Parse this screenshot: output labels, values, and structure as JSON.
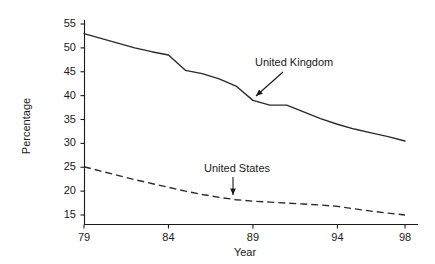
{
  "chart_data": {
    "type": "line",
    "title": "",
    "xlabel": "Year",
    "ylabel": "Percentage",
    "xlim": [
      78.0,
      99.2
    ],
    "ylim": [
      13.0,
      56.8
    ],
    "grid": false,
    "legend_position": "inline-annotations",
    "x_ticks": [
      79,
      84,
      89,
      94,
      98
    ],
    "x_tick_labels": [
      "79",
      "84",
      "89",
      "94",
      "98"
    ],
    "y_ticks": [
      15,
      20,
      25,
      30,
      35,
      40,
      45,
      50,
      55
    ],
    "y_tick_labels": [
      "15",
      "20",
      "25",
      "30",
      "35",
      "40",
      "45",
      "50",
      "55"
    ],
    "x": [
      79,
      80,
      81,
      82,
      83,
      84,
      85,
      86,
      87,
      88,
      89,
      90,
      91,
      92,
      93,
      94,
      95,
      96,
      97,
      98
    ],
    "series": [
      {
        "name": "United Kingdom",
        "style": "solid",
        "color": "#2b2b2b",
        "annotation": "United Kingdom",
        "values": [
          53.0,
          52.0,
          51.0,
          50.0,
          49.2,
          48.5,
          45.3,
          44.6,
          43.5,
          42.0,
          39.0,
          38.0,
          38.0,
          36.6,
          35.2,
          34.0,
          33.0,
          32.2,
          31.4,
          30.5
        ]
      },
      {
        "name": "United States",
        "style": "dashed",
        "color": "#2b2b2b",
        "annotation": "United States",
        "values": [
          25.1,
          24.2,
          23.3,
          22.4,
          21.6,
          20.8,
          20.0,
          19.3,
          18.7,
          18.2,
          17.9,
          17.7,
          17.5,
          17.3,
          17.1,
          16.8,
          16.3,
          15.8,
          15.4,
          15.0
        ]
      }
    ]
  },
  "annotations": {
    "uk_label": "United Kingdom",
    "us_label": "United States"
  },
  "axes": {
    "y_title": "Percentage",
    "x_title": "Year"
  },
  "colors": {
    "line": "#2b2b2b",
    "axis": "#1a1a1a",
    "background": "#ffffff"
  }
}
